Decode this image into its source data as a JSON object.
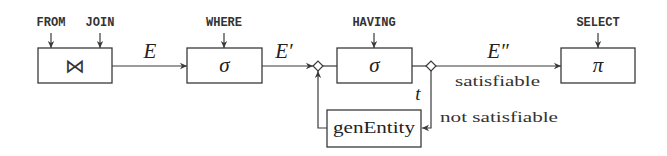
{
  "diagram": {
    "inputs": {
      "from": "FROM",
      "join": "JOIN",
      "where": "WHERE",
      "having": "HAVING",
      "select": "SELECT"
    },
    "operators": {
      "join": "⋈",
      "where": "σ",
      "having": "σ",
      "select": "π",
      "gen_entity": "genEntity"
    },
    "edges": {
      "e": "E",
      "e_prime": "E′",
      "e_double_prime": "E″",
      "t": "t",
      "satisfiable": "satisfiable",
      "not_satisfiable": "not satisfiable"
    },
    "colors": {
      "stroke": "#3a3a3a",
      "text": "#222222",
      "background": "#ffffff"
    }
  }
}
